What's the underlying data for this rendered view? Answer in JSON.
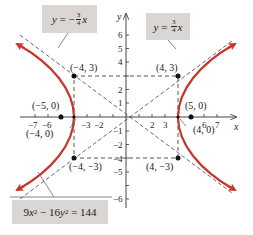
{
  "diagram": {
    "type": "hyperbola",
    "equation": {
      "lhs_a": "9",
      "var_x": "x",
      "exp": "2",
      "minus": " − 16",
      "var_y": "y",
      "rhs": " = 144"
    },
    "asymptote_neg": {
      "y": "y",
      "eq": " = −",
      "num": "3",
      "den": "4",
      "x": "x"
    },
    "asymptote_pos": {
      "y": "y",
      "eq": " = ",
      "num": "3",
      "den": "4",
      "x": "x"
    },
    "axes": {
      "x_label": "x",
      "y_label": "y"
    },
    "x_ticks": [
      "−7",
      "−6",
      "−3",
      "−2",
      "2",
      "3",
      "6",
      "7"
    ],
    "y_ticks": [
      "6",
      "5",
      "4",
      "2",
      "1",
      "−1",
      "−2",
      "−4",
      "−5",
      "−6"
    ],
    "points": {
      "p_neg4_3": "(−4, 3)",
      "p_4_3": "(4, 3)",
      "p_neg5_0": "(−5, 0)",
      "p_5_0": "(5, 0)",
      "p_neg4_0": "(−4, 0)",
      "p_4_0": "(4, 0)",
      "p_neg4_neg3": "(−4, −3)",
      "p_4_neg3": "(4, −3)"
    },
    "colors": {
      "curve": "#c8352a",
      "box_fill": "#d9d6d3",
      "lines": "#333333"
    }
  }
}
